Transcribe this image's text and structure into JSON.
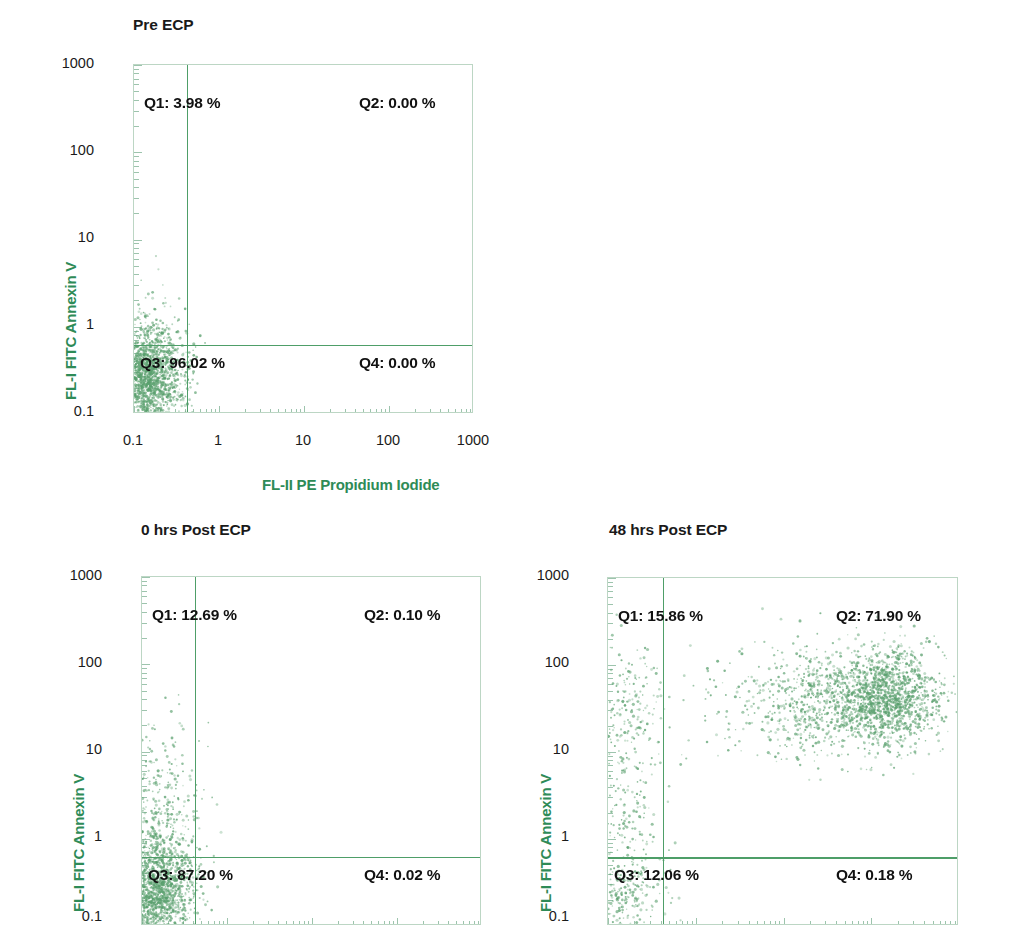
{
  "figure": {
    "type": "flow-cytometry-dotplots",
    "accent_green": "#2e8b57",
    "frame_green": "#bcd6c4",
    "quadrant_green": "#4e9e68",
    "dot_green": "#5aa06e"
  },
  "axes": {
    "y_title": "FL-I FITC Annexin V",
    "x_title": "FL-II PE Propidium Iodide",
    "y_ticks": [
      "1000",
      "100",
      "10",
      "1",
      "0.1"
    ],
    "x_ticks": [
      "0.1",
      "1",
      "10",
      "100",
      "1000"
    ],
    "x_min": 0.1,
    "x_max": 1000,
    "y_min": 0.1,
    "y_max": 1000,
    "scale": "log"
  },
  "panels": [
    {
      "id": "pre-ecp",
      "title": "Pre ECP",
      "quadrants": {
        "q1": "Q1: 3.98 %",
        "q2": "Q2: 0.00 %",
        "q3": "Q3: 96.02 %",
        "q4": "Q4: 0.00 %"
      },
      "quadrant_values": {
        "q1": 3.98,
        "q2": 0.0,
        "q3": 96.02,
        "q4": 0.0
      },
      "gate": {
        "x": 0.42,
        "y": 0.62
      }
    },
    {
      "id": "0hrs-post-ecp",
      "title": "0 hrs Post ECP",
      "quadrants": {
        "q1": "Q1: 12.69 %",
        "q2": "Q2: 0.10 %",
        "q3": "Q3: 87.20 %",
        "q4": "Q4: 0.02 %"
      },
      "quadrant_values": {
        "q1": 12.69,
        "q2": 0.1,
        "q3": 87.2,
        "q4": 0.02
      },
      "gate": {
        "x": 0.42,
        "y": 0.62
      }
    },
    {
      "id": "48hrs-post-ecp",
      "title": "48 hrs Post ECP",
      "quadrants": {
        "q1": "Q1: 15.86 %",
        "q2": "Q2: 71.90 %",
        "q3": "Q3: 12.06 %",
        "q4": "Q4: 0.18 %"
      },
      "quadrant_values": {
        "q1": 15.86,
        "q2": 71.9,
        "q3": 12.06,
        "q4": 0.18
      },
      "gate": {
        "x": 0.42,
        "y": 0.62
      }
    }
  ],
  "chart_data": {
    "type": "scatter",
    "xlabel": "FL-II PE Propidium Iodide",
    "ylabel": "FL-I FITC Annexin V",
    "xlim": [
      0.1,
      1000
    ],
    "ylim": [
      0.1,
      1000
    ],
    "xscale": "log",
    "yscale": "log",
    "grid": false,
    "legend": "none",
    "panels": [
      {
        "name": "Pre ECP",
        "gate_x": 0.42,
        "gate_y": 0.62,
        "quadrant_percentages": {
          "Q1": 3.98,
          "Q2": 0.0,
          "Q3": 96.02,
          "Q4": 0.0
        },
        "clusters": [
          {
            "cx": 0.145,
            "cy": 0.26,
            "sx": 0.22,
            "sy": 0.3,
            "n": 1700
          },
          {
            "cx": 0.15,
            "cy": 0.8,
            "sx": 0.22,
            "sy": 0.38,
            "n": 90
          }
        ]
      },
      {
        "name": "0 hrs Post ECP",
        "gate_x": 0.42,
        "gate_y": 0.62,
        "quadrant_percentages": {
          "Q1": 12.69,
          "Q2": 0.1,
          "Q3": 87.2,
          "Q4": 0.02
        },
        "clusters": [
          {
            "cx": 0.15,
            "cy": 0.26,
            "sx": 0.22,
            "sy": 0.3,
            "n": 1500
          },
          {
            "cx": 0.16,
            "cy": 1.6,
            "sx": 0.24,
            "sy": 0.55,
            "n": 420
          }
        ]
      },
      {
        "name": "48 hrs Post ECP",
        "gate_x": 0.42,
        "gate_y": 0.62,
        "quadrant_percentages": {
          "Q1": 15.86,
          "Q2": 71.9,
          "Q3": 12.06,
          "Q4": 0.18
        },
        "clusters": [
          {
            "cx": 0.15,
            "cy": 0.25,
            "sx": 0.2,
            "sy": 0.28,
            "n": 230
          },
          {
            "cx": 0.16,
            "cy": 2.5,
            "sx": 0.22,
            "sy": 0.8,
            "n": 270
          },
          {
            "cx": 0.17,
            "cy": 40.0,
            "sx": 0.22,
            "sy": 0.35,
            "n": 120
          },
          {
            "cx": 150.0,
            "cy": 42.0,
            "sx": 0.3,
            "sy": 0.28,
            "n": 1500
          },
          {
            "cx": 30.0,
            "cy": 38.0,
            "sx": 0.38,
            "sy": 0.3,
            "n": 500
          },
          {
            "cx": 6.0,
            "cy": 35.0,
            "sx": 0.45,
            "sy": 0.32,
            "n": 170
          }
        ]
      }
    ]
  }
}
